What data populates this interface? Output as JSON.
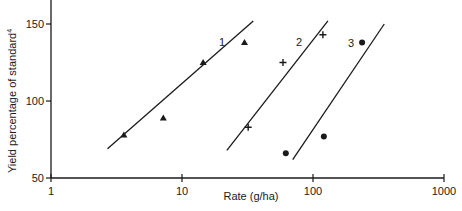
{
  "chart_data": {
    "type": "scatter",
    "title": "",
    "xlabel": "Rate (g/ha)",
    "ylabel": "Yield percentage of standard",
    "ylabel_superscript": "4",
    "xscale": "log",
    "xlim": [
      1,
      1000
    ],
    "ylim": [
      50,
      160
    ],
    "xticks": [
      "1",
      "10",
      "100",
      "1000"
    ],
    "yticks": [
      "50",
      "100",
      "150"
    ],
    "grid": false,
    "legend": "none (series labelled 1, 2, 3 on lines)",
    "series": [
      {
        "name": "1",
        "marker": "triangle",
        "points": [
          [
            3.6,
            78
          ],
          [
            7.2,
            89
          ],
          [
            14.5,
            125
          ],
          [
            30,
            138
          ]
        ],
        "fit_line": [
          [
            2.7,
            69
          ],
          [
            35,
            152
          ]
        ]
      },
      {
        "name": "2",
        "marker": "plus",
        "points": [
          [
            32,
            83
          ],
          [
            59,
            125
          ],
          [
            119,
            143
          ]
        ],
        "fit_line": [
          [
            22,
            68
          ],
          [
            130,
            152
          ]
        ]
      },
      {
        "name": "3",
        "marker": "dot",
        "points": [
          [
            62,
            66
          ],
          [
            121,
            77
          ],
          [
            237,
            138
          ]
        ],
        "fit_line": [
          [
            70,
            62
          ],
          [
            350,
            150
          ]
        ]
      }
    ]
  },
  "labels": {
    "x_axis_title": "Rate (g/ha)",
    "y_axis_title": "Yield percentage of standard",
    "y_axis_sup": "4",
    "series_labels": [
      "1",
      "2",
      "3"
    ]
  }
}
